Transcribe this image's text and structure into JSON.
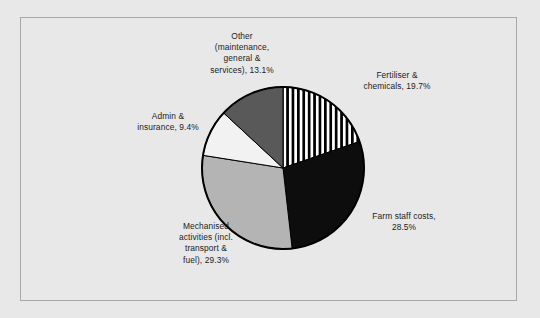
{
  "chart_data": {
    "type": "pie",
    "title": "",
    "xlabel": "",
    "ylabel": "",
    "grid": false,
    "legend_position": "none",
    "labels_outside": true,
    "start_angle_deg": 0,
    "direction": "clockwise",
    "categories": [
      "Fertiliser & chemicals",
      "Farm staff costs",
      "Mechanised activities (incl. transport & fuel)",
      "Admin & insurance",
      "Other (maintenance, general & services)"
    ],
    "values": [
      19.7,
      28.5,
      29.3,
      9.4,
      13.1
    ],
    "units": "%",
    "slices": [
      {
        "name": "Fertiliser & chemicals",
        "value": 19.7,
        "label_text": "Fertiliser &\nchemicals, 19.7%",
        "fill": "vertical-stripes",
        "fill_color": "#000000",
        "fill_background": "#ffffff"
      },
      {
        "name": "Farm staff costs",
        "value": 28.5,
        "label_text": "Farm staff costs,\n28.5%",
        "fill": "solid",
        "fill_color": "#0d0d0d",
        "fill_background": "#0d0d0d"
      },
      {
        "name": "Mechanised activities (incl. transport & fuel)",
        "value": 29.3,
        "label_text": "Mechanised\nactivities (incl.\ntransport &\nfuel), 29.3%",
        "fill": "solid",
        "fill_color": "#b4b4b4",
        "fill_background": "#b4b4b4"
      },
      {
        "name": "Admin & insurance",
        "value": 9.4,
        "label_text": "Admin &\ninsurance, 9.4%",
        "fill": "solid",
        "fill_color": "#f2f2f2",
        "fill_background": "#f2f2f2"
      },
      {
        "name": "Other (maintenance, general & services)",
        "value": 13.1,
        "label_text": "Other\n(maintenance,\ngeneral &\nservices), 13.1%",
        "fill": "solid",
        "fill_color": "#595959",
        "fill_background": "#595959"
      }
    ]
  },
  "colors": {
    "page_background": "#e8e8e8",
    "frame_border": "#a8a8a8",
    "outline": "#000000",
    "text": "#1c1c1c"
  },
  "geometry": {
    "center_x": 283,
    "center_y": 168,
    "radius": 81,
    "outline_width": 2
  }
}
